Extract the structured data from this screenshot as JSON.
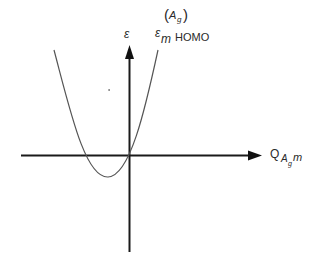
{
  "diagram": {
    "type": "energy-vs-coordinate",
    "y_axis": {
      "label": "ε"
    },
    "x_axis": {
      "label_main": "Q",
      "label_sub1": "A",
      "label_sub2": "g",
      "label_tail": "m"
    },
    "curve": {
      "label_symbol": "ε",
      "label_sub": "m",
      "label_sup_open": "(",
      "label_sup_A": "A",
      "label_sup_g": "g",
      "label_sup_close": ")",
      "label_text": "HOMO",
      "shape": "parabola",
      "minimum_position": "left of origin, below axis"
    },
    "colors": {
      "axis": "#1a1a1a",
      "curve": "#555555",
      "text": "#2a2a2a"
    }
  }
}
